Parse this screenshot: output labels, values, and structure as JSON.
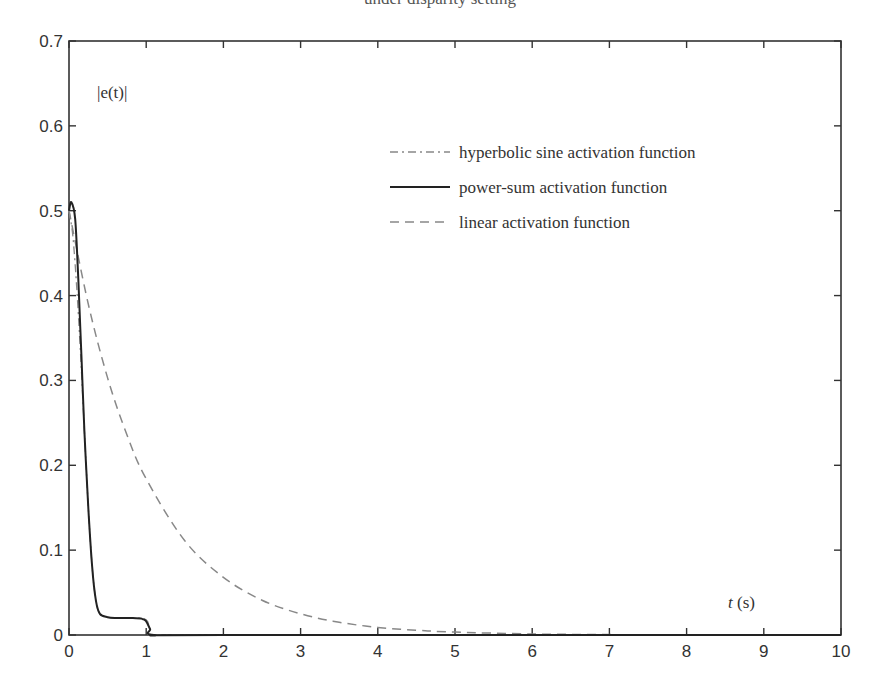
{
  "figure": {
    "title_partial": "under disparity setting"
  },
  "chart_data": {
    "type": "line",
    "title": "",
    "xlabel": "t (s)",
    "ylabel": "|e(t)|",
    "xlim": [
      0,
      10
    ],
    "ylim": [
      0,
      0.7
    ],
    "x_ticks": [
      "0",
      "1",
      "2",
      "3",
      "4",
      "5",
      "6",
      "7",
      "8",
      "9",
      "10"
    ],
    "y_ticks": [
      "0",
      "0.1",
      "0.2",
      "0.3",
      "0.4",
      "0.5",
      "0.6",
      "0.7"
    ],
    "grid": false,
    "legend_position": "upper-right inside",
    "series": [
      {
        "name": "hyperbolic sine activation function",
        "style": "dash-dot",
        "color": "#888888",
        "x": [
          0,
          0.05,
          0.1,
          0.15,
          0.2,
          0.25,
          0.3,
          0.35,
          0.4,
          0.5,
          0.6,
          0.8,
          1.0,
          1.05,
          1.1,
          2,
          10
        ],
        "y": [
          0.5,
          0.47,
          0.41,
          0.33,
          0.24,
          0.15,
          0.08,
          0.04,
          0.025,
          0.021,
          0.02,
          0.02,
          0.018,
          0.005,
          0,
          0,
          0
        ]
      },
      {
        "name": "power-sum activation function",
        "style": "solid",
        "color": "#222222",
        "x": [
          0,
          0.03,
          0.08,
          0.12,
          0.16,
          0.2,
          0.25,
          0.3,
          0.35,
          0.4,
          0.5,
          0.6,
          0.8,
          0.95,
          1.0,
          1.05,
          1.1,
          2,
          10
        ],
        "y": [
          0.5,
          0.51,
          0.49,
          0.42,
          0.33,
          0.24,
          0.15,
          0.08,
          0.04,
          0.025,
          0.021,
          0.02,
          0.02,
          0.019,
          0.016,
          0.007,
          0,
          0,
          0
        ]
      },
      {
        "name": "linear activation function",
        "style": "dashed",
        "color": "#888888",
        "x": [
          0,
          0.25,
          0.5,
          0.75,
          1.0,
          1.5,
          2.0,
          2.5,
          3.0,
          3.5,
          4.0,
          4.5,
          5.0,
          6.0,
          7.0,
          8.0,
          10.0
        ],
        "y": [
          0.5,
          0.39,
          0.303,
          0.236,
          0.184,
          0.111,
          0.068,
          0.041,
          0.025,
          0.015,
          0.009,
          0.0056,
          0.0034,
          0.0012,
          0.0005,
          0.0002,
          0.0
        ]
      }
    ],
    "annotations": [
      {
        "text": "|e(t)|",
        "x": 0.45,
        "y": 0.645
      },
      {
        "text": "t (s)",
        "x": 8.3,
        "y": 0.035
      }
    ]
  },
  "labels": {
    "ylabel_text": "|e(t)|",
    "xlabel_t": "t",
    "xlabel_unit": " (s)"
  },
  "legend": [
    {
      "label": "hyperbolic sine activation function"
    },
    {
      "label": "power-sum activation function"
    },
    {
      "label": "linear activation function"
    }
  ]
}
